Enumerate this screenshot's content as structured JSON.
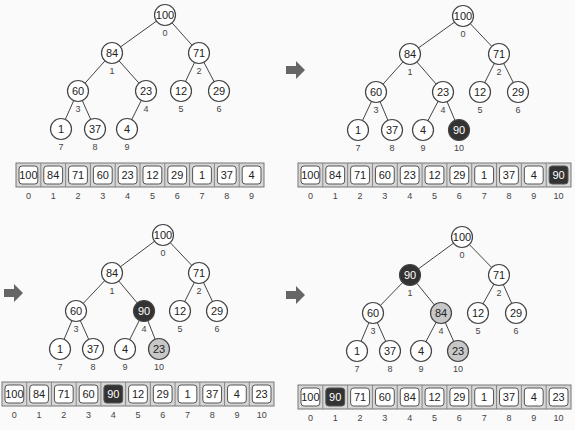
{
  "colors": {
    "node_fill": "#ffffff",
    "highlight_dark": "#333333",
    "highlight_light": "#c8c8c8",
    "stroke": "#444444",
    "array_bg": "#d6d6d6",
    "arrow": "#666666"
  },
  "panels": [
    {
      "id": "p1",
      "values": [
        100,
        84,
        71,
        60,
        23,
        12,
        29,
        1,
        37,
        4
      ],
      "dark": [],
      "light": [],
      "arrow": false
    },
    {
      "id": "p2",
      "values": [
        100,
        84,
        71,
        60,
        23,
        12,
        29,
        1,
        37,
        4,
        90
      ],
      "dark": [
        10
      ],
      "light": [],
      "arrow": true
    },
    {
      "id": "p3",
      "values": [
        100,
        84,
        71,
        60,
        90,
        12,
        29,
        1,
        37,
        4,
        23
      ],
      "dark": [
        4
      ],
      "light": [
        10
      ],
      "arrow": true
    },
    {
      "id": "p4",
      "values": [
        100,
        90,
        71,
        60,
        84,
        12,
        29,
        1,
        37,
        4,
        23
      ],
      "dark": [
        1
      ],
      "light": [
        4,
        10
      ],
      "arrow": true
    }
  ]
}
